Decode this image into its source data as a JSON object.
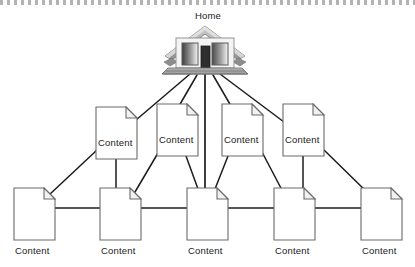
{
  "diagram": {
    "title_node": {
      "label": "Home",
      "icon": "house-icon",
      "label_x": 186,
      "label_y": 10
    },
    "colors": {
      "background": "#ffffff",
      "line": "#1c1c1c",
      "doc_stroke": "#6b6b6b",
      "doc_fill": "#ffffff",
      "fold_fill": "#f2f2f2",
      "text": "#1a1a1a",
      "roof_dark": "#7d7d7d",
      "roof_light": "#d8d8d8",
      "wall": "#f4f4f4",
      "window_dark": "#3a3a3a",
      "window_light": "#efefef",
      "door": "#2e2e2e",
      "base_gray": "#9a9a9a"
    },
    "middle_row": [
      {
        "label": "Content",
        "x": 96,
        "y": 107,
        "w": 41,
        "h": 52
      },
      {
        "label": "Content",
        "x": 157,
        "y": 104,
        "w": 41,
        "h": 52
      },
      {
        "label": "Content",
        "x": 222,
        "y": 104,
        "w": 41,
        "h": 52
      },
      {
        "label": "Content",
        "x": 283,
        "y": 104,
        "w": 41,
        "h": 52
      }
    ],
    "bottom_row": [
      {
        "label": "Content",
        "x": 14,
        "y": 188,
        "w": 41,
        "h": 52,
        "label_x": 15,
        "label_y": 245
      },
      {
        "label": "Content",
        "x": 100,
        "y": 188,
        "w": 41,
        "h": 52,
        "label_x": 101,
        "label_y": 245
      },
      {
        "label": "Content",
        "x": 187,
        "y": 188,
        "w": 41,
        "h": 52,
        "label_x": 188,
        "label_y": 245
      },
      {
        "label": "Content",
        "x": 274,
        "y": 188,
        "w": 41,
        "h": 52,
        "label_x": 275,
        "label_y": 245
      },
      {
        "label": "Content",
        "x": 361,
        "y": 188,
        "w": 41,
        "h": 52,
        "label_x": 362,
        "label_y": 245
      }
    ],
    "connections_from_home": [
      {
        "from": "home",
        "to": "middle-1"
      },
      {
        "from": "home",
        "to": "middle-2"
      },
      {
        "from": "home",
        "to": "bottom-3"
      },
      {
        "from": "home",
        "to": "middle-3"
      },
      {
        "from": "home",
        "to": "middle-4"
      }
    ],
    "connections_middle_to_bottom": [
      {
        "from": "middle-1",
        "to": "bottom-1"
      },
      {
        "from": "middle-1",
        "to": "bottom-2"
      },
      {
        "from": "middle-2",
        "to": "bottom-2"
      },
      {
        "from": "middle-2",
        "to": "bottom-3"
      },
      {
        "from": "middle-3",
        "to": "bottom-3"
      },
      {
        "from": "middle-3",
        "to": "bottom-4"
      },
      {
        "from": "middle-4",
        "to": "bottom-4"
      },
      {
        "from": "middle-4",
        "to": "bottom-5"
      }
    ],
    "connections_bottom_chain": [
      {
        "from": "bottom-1",
        "to": "bottom-2"
      },
      {
        "from": "bottom-2",
        "to": "bottom-3"
      },
      {
        "from": "bottom-3",
        "to": "bottom-4"
      },
      {
        "from": "bottom-4",
        "to": "bottom-5"
      }
    ]
  }
}
